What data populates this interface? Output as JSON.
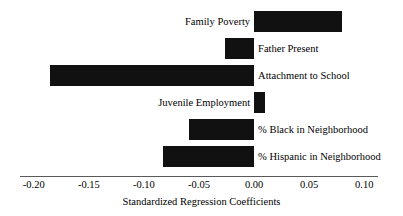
{
  "chart_data": {
    "type": "bar",
    "orientation": "horizontal",
    "title": "",
    "subtitle": "",
    "xlabel": "Standardized Regression Coefficients",
    "ylabel": "",
    "categories": [
      "Family Poverty",
      "Father Present",
      "Attachment to School",
      "Juvenile Employment",
      "% Black in Neighborhood",
      "% Hispanic in Neighborhood"
    ],
    "values": [
      0.08,
      -0.026,
      -0.185,
      0.01,
      -0.059,
      -0.083
    ],
    "series": [
      {
        "name": "Standardized Regression Coefficients",
        "values": [
          0.08,
          -0.026,
          -0.185,
          0.01,
          -0.059,
          -0.083
        ]
      }
    ],
    "xlim": [
      -0.2125,
      0.1125
    ],
    "xticks": [
      -0.2,
      -0.15,
      -0.1,
      -0.05,
      0.0,
      0.05,
      0.1
    ],
    "xticklabels": [
      "-0.20",
      "-0.15",
      "-0.10",
      "-0.05",
      "0.00",
      "0.05",
      "0.10"
    ],
    "grid": false,
    "legend": false,
    "legend_position": "none",
    "bar_color": "#111111",
    "axis_color": "#5a5a5a",
    "background_color": "#ffffff",
    "label_placement": "outside-opposite-bar",
    "annotations": []
  },
  "axis": {
    "title": "Standardized Regression Coefficients",
    "ticks": [
      {
        "label": "-0.20",
        "value": -0.2
      },
      {
        "label": "-0.15",
        "value": -0.15
      },
      {
        "label": "-0.10",
        "value": -0.1
      },
      {
        "label": "-0.05",
        "value": -0.05
      },
      {
        "label": "0.00",
        "value": 0
      },
      {
        "label": "0.05",
        "value": 0.05
      },
      {
        "label": "0.10",
        "value": 0.1
      }
    ]
  },
  "bars": [
    {
      "label": "Family Poverty",
      "value": 0.08,
      "label_side": "left"
    },
    {
      "label": "Father Present",
      "value": -0.026,
      "label_side": "right"
    },
    {
      "label": "Attachment to School",
      "value": -0.185,
      "label_side": "right"
    },
    {
      "label": "Juvenile Employment",
      "value": 0.01,
      "label_side": "left"
    },
    {
      "label": "% Black in Neighborhood",
      "value": -0.059,
      "label_side": "right"
    },
    {
      "label": "% Hispanic in Neighborhood",
      "value": -0.083,
      "label_side": "right"
    }
  ]
}
